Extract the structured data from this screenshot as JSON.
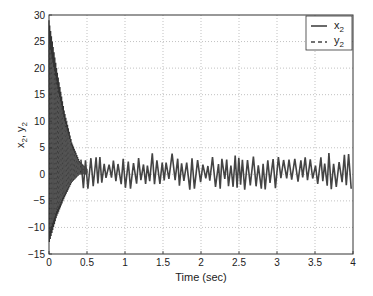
{
  "chart_data": {
    "type": "line",
    "title": "",
    "xlabel": "Time (sec)",
    "ylabel": "x2, y2",
    "xlim": [
      0,
      4
    ],
    "ylim": [
      -15,
      30
    ],
    "xticks": [
      0,
      0.5,
      1,
      1.5,
      2,
      2.5,
      3,
      3.5,
      4
    ],
    "xtick_labels": [
      "0",
      "0.5",
      "1",
      "1.5",
      "2",
      "2.5",
      "3",
      "3.5",
      "4"
    ],
    "yticks": [
      -15,
      -10,
      -5,
      0,
      5,
      10,
      15,
      20,
      25,
      30
    ],
    "ytick_labels": [
      "-15",
      "-10",
      "-5",
      "0",
      "5",
      "10",
      "15",
      "20",
      "25",
      "30"
    ],
    "grid": true,
    "legend": {
      "position": "upper right",
      "entries": [
        {
          "name": "x2",
          "style": "solid"
        },
        {
          "name": "y2",
          "style": "dashed"
        }
      ]
    },
    "series": [
      {
        "name": "x2",
        "style": "solid",
        "color": "#444444",
        "description": "synchronized chaotic response oscillating between about -3 and 4 after t≈0.45",
        "steady_range": [
          -3,
          4.2
        ]
      },
      {
        "name": "y2",
        "style": "dashed",
        "color": "#444444",
        "description": "initial transient decaying from ~29 (upper) and ~-13 (lower) to synchronize with x2 by t≈0.5",
        "transient_upper": {
          "t": [
            0,
            0.1,
            0.2,
            0.3,
            0.4,
            0.5
          ],
          "v": [
            29,
            20,
            12,
            6,
            2.5,
            1
          ]
        },
        "transient_lower": {
          "t": [
            0,
            0.1,
            0.2,
            0.3,
            0.4,
            0.5
          ],
          "v": [
            -13,
            -8,
            -4.5,
            -1.5,
            0,
            0
          ]
        }
      }
    ]
  },
  "legend_labels": {
    "x2_main": "x",
    "x2_sub": "2",
    "y2_main": "y",
    "y2_sub": "2"
  },
  "axis": {
    "xlabel": "Time (sec)",
    "ylabel_main1": "x",
    "ylabel_sub1": "2",
    "ylabel_sep": ", ",
    "ylabel_main2": "y",
    "ylabel_sub2": "2"
  }
}
